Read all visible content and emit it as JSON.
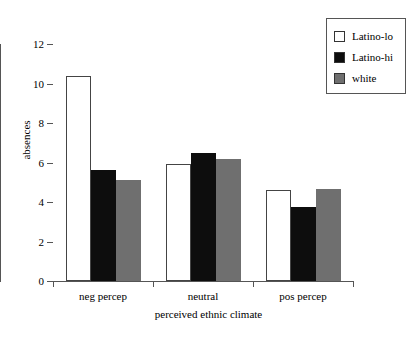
{
  "chart_data": {
    "type": "bar",
    "title": "",
    "xlabel": "perceived ethnic climate",
    "ylabel": "absences",
    "categories": [
      "neg percep",
      "neutral",
      "pos percep"
    ],
    "series": [
      {
        "name": "Latino-lo",
        "color": "#ffffff",
        "values": [
          10.4,
          5.9,
          4.6
        ]
      },
      {
        "name": "Latino-hi",
        "color": "#0d0d0d",
        "values": [
          5.6,
          6.5,
          3.75
        ]
      },
      {
        "name": "white",
        "color": "#6f6f6f",
        "values": [
          5.1,
          6.2,
          4.65
        ]
      }
    ],
    "ylim": [
      0,
      12
    ],
    "yticks": [
      0,
      2,
      4,
      6,
      8,
      10,
      12
    ],
    "ytick_labels": [
      "0",
      "2",
      "4",
      "6",
      "8",
      "10",
      "12"
    ],
    "grid": false,
    "legend_position": "top-right"
  },
  "legend": {
    "items": [
      {
        "label": "Latino-lo",
        "swatch": "open-white-square"
      },
      {
        "label": "Latino-hi",
        "swatch": "filled-black-square"
      },
      {
        "label": "white",
        "swatch": "filled-gray-square"
      }
    ]
  }
}
